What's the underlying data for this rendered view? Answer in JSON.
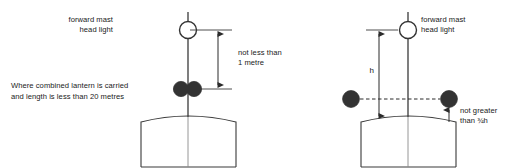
{
  "figure": {
    "type": "technical-diagram",
    "background_color": "#ffffff",
    "line_color": "#3a3a3a",
    "lamp_dark_color": "#333333",
    "lamp_open_color": "#ffffff"
  },
  "left_diagram": {
    "name": "combined-lantern-arrangement",
    "masthead_label_line1": "forward mast",
    "masthead_label_line2": "head light",
    "dimension_label_line1": "not less than",
    "dimension_label_line2": "1 metre",
    "lantern_label_line1": "Where combined lantern is carried",
    "lantern_label_line2": "and length is less than 20 metres",
    "masthead_light_icon": "open-circle-lamp",
    "combined_lantern_icon": "twin-dark-circle-lamp"
  },
  "right_diagram": {
    "name": "sidelight-height-ratio",
    "masthead_label_line1": "forward mast",
    "masthead_label_line2": "head light",
    "height_dimension_label": "h",
    "ratio_label_line1": "not greater",
    "ratio_label_line2": "than ¾h",
    "masthead_light_icon": "open-circle-lamp",
    "sidelight_icon": "dark-circle-lamp"
  }
}
